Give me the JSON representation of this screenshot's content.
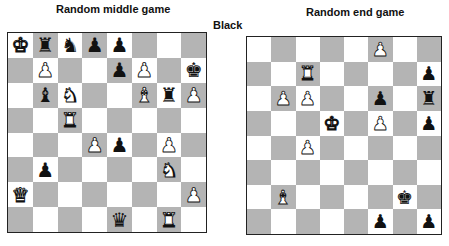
{
  "labels": {
    "left_title": "Random middle game",
    "right_title": "Random end game",
    "side_label": "Black"
  },
  "colors": {
    "light_square": "#ffffff",
    "dark_square": "#b4b4b4",
    "border": "#222222"
  },
  "boards": [
    {
      "name": "middle-game",
      "rows": [
        [
          "wK",
          "bR",
          "bN",
          "bP",
          "bP",
          "",
          "",
          ""
        ],
        [
          "",
          "wP",
          "",
          "",
          "bP",
          "wP",
          "",
          "bK"
        ],
        [
          "",
          "bB",
          "wN",
          "",
          "",
          "wB",
          "bR",
          "wP"
        ],
        [
          "",
          "",
          "wR",
          "",
          "",
          "",
          "",
          ""
        ],
        [
          "",
          "",
          "",
          "wP",
          "bP",
          "",
          "wP",
          ""
        ],
        [
          "",
          "bP",
          "",
          "",
          "",
          "",
          "wN",
          ""
        ],
        [
          "wQ",
          "",
          "",
          "",
          "",
          "",
          "",
          "wP"
        ],
        [
          "",
          "",
          "",
          "",
          "bQ",
          "",
          "wR",
          ""
        ]
      ]
    },
    {
      "name": "end-game",
      "rows": [
        [
          "",
          "",
          "",
          "",
          "",
          "wP",
          "",
          ""
        ],
        [
          "",
          "",
          "wR",
          "",
          "",
          "",
          "",
          "bP"
        ],
        [
          "",
          "wP",
          "wP",
          "",
          "",
          "bP",
          "",
          "bR"
        ],
        [
          "",
          "",
          "",
          "wK",
          "",
          "wP",
          "",
          "bP"
        ],
        [
          "",
          "",
          "wP",
          "",
          "",
          "",
          "",
          ""
        ],
        [
          "",
          "",
          "",
          "",
          "",
          "",
          "",
          ""
        ],
        [
          "",
          "wB",
          "",
          "",
          "",
          "",
          "bK",
          ""
        ],
        [
          "",
          "",
          "",
          "",
          "",
          "bP",
          "",
          "bP"
        ]
      ]
    }
  ],
  "piece_glyphs": {
    "K": "♚",
    "Q": "♛",
    "R": "♜",
    "B": "♝",
    "N": "♞",
    "P": "♟"
  },
  "piece_names": {
    "K": "king",
    "Q": "queen",
    "R": "rook",
    "B": "bishop",
    "N": "knight",
    "P": "pawn"
  }
}
